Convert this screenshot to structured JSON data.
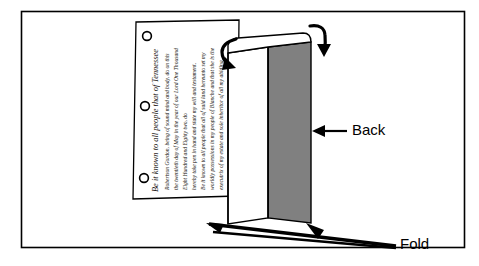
{
  "figure": {
    "frame": {
      "border_color": "#000000",
      "background": "#ffffff",
      "x": 21,
      "y": 11,
      "width": 444,
      "height": 237
    },
    "colors": {
      "ink": "#000000",
      "back_panel_gray": "#808080",
      "paper_white": "#ffffff",
      "script_ink": "#15110d",
      "frame_border": "#000000"
    },
    "labels": [
      {
        "id": "back",
        "text": "Back",
        "x": 355,
        "y": 131,
        "leader_from_x": 347,
        "leader_to_x": 318,
        "leader_y": 131,
        "arrow_target": "gray-back-panel"
      },
      {
        "id": "fold",
        "text": "Fold",
        "x": 404,
        "y": 245,
        "leader_from_x": 396,
        "leader_to_x": 330,
        "leader_y": 239,
        "arrow_target": "bottom-fold-line"
      }
    ],
    "curved_arrows": [
      {
        "id": "top-left-fold-arrow",
        "description": "curved arrow over the left fold crease pointing down-left",
        "direction": "down-left"
      },
      {
        "id": "top-right-fold-arrow",
        "description": "curved arrow over the right back panel pointing down",
        "direction": "down"
      }
    ],
    "straight_arrows": [
      {
        "id": "fold-arrow-left",
        "description": "arrowhead at left end of bottom fold line pointing left"
      },
      {
        "id": "fold-arrow-right",
        "description": "arrowhead pointing up-left at the base of the back panel"
      },
      {
        "id": "back-leader-arrow",
        "description": "arrowhead pointing left into the gray back panel"
      }
    ],
    "document": {
      "id": "certificate-sheet",
      "description": "Handwritten certificate sheet with three punched holes along its left edge, text set sideways",
      "punch_holes": 3,
      "script_lines": [
        "Be it known to all people that of Tennessee",
        "Robertson Gordon, being of sound mind and body, do on this",
        "the twentieth day of May in the year of our Lord One Thousand",
        "Eight Hundred and Eighty two, do",
        "hereby take pen in hand and state my will and testament.",
        "Be it known to all people that all of said land hereunto set my",
        "worldly possessions in my people of Blanche and that she is the",
        "executrix of my estate and sole inheritor of all my abiding",
        "goods and chattels as witness my hand and seal"
      ]
    },
    "panels": [
      {
        "id": "front-white-panel",
        "fill": "#ffffff",
        "label": "front"
      },
      {
        "id": "gray-back-panel",
        "fill": "#808080",
        "label": "Back"
      },
      {
        "id": "top-edge-band",
        "fill": "#ffffff",
        "label": "top edge"
      }
    ]
  }
}
